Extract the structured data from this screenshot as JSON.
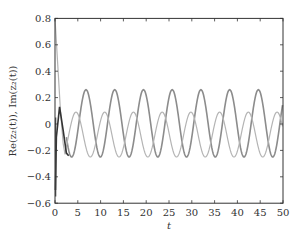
{
  "chart_data": {
    "type": "line",
    "title": "",
    "xlabel": "t",
    "ylabel": "Re(z₂(t)), Im(z₂(t))",
    "xlim": [
      0,
      50
    ],
    "ylim": [
      -0.6,
      0.8
    ],
    "xticks": [
      0,
      5,
      10,
      15,
      20,
      25,
      30,
      35,
      40,
      45,
      50
    ],
    "yticks": [
      -0.6,
      -0.4,
      -0.2,
      0,
      0.2,
      0.4,
      0.6,
      0.8
    ],
    "xtick_labels": [
      "0",
      "5",
      "10",
      "15",
      "20",
      "25",
      "30",
      "35",
      "40",
      "45",
      "50"
    ],
    "ytick_labels": [
      "−0.6",
      "−0.4",
      "−0.2",
      "0",
      "0.2",
      "0.4",
      "0.6",
      "0.8"
    ],
    "grid": false,
    "legend": null,
    "series": [
      {
        "name": "Re(z2(t))",
        "color": "#8c8c8c",
        "description": "oscillation after transient, period ~6.3",
        "peak": 0.26,
        "trough": -0.25,
        "period": 6.3,
        "peaks_t": [
          6.8,
          13.1,
          19.4,
          25.7,
          32.0,
          38.3,
          44.6
        ]
      },
      {
        "name": "Im(z2(t))",
        "color": "#b4b4b4",
        "description": "starts at 0.8, drops, then oscillates",
        "start": 0.8,
        "peak": 0.09,
        "trough": -0.25,
        "period": 6.3,
        "peaks_t": [
          4.6,
          10.9,
          17.2,
          23.5,
          29.8,
          36.1,
          42.4,
          48.7
        ]
      },
      {
        "name": "transient",
        "color": "#333333",
        "description": "initial transient t in [0,3]",
        "points": [
          [
            0.1,
            -0.5
          ],
          [
            0.3,
            -0.1
          ],
          [
            1.0,
            0.13
          ],
          [
            1.8,
            -0.05
          ],
          [
            2.5,
            -0.22
          ],
          [
            3.0,
            -0.24
          ]
        ]
      }
    ]
  }
}
